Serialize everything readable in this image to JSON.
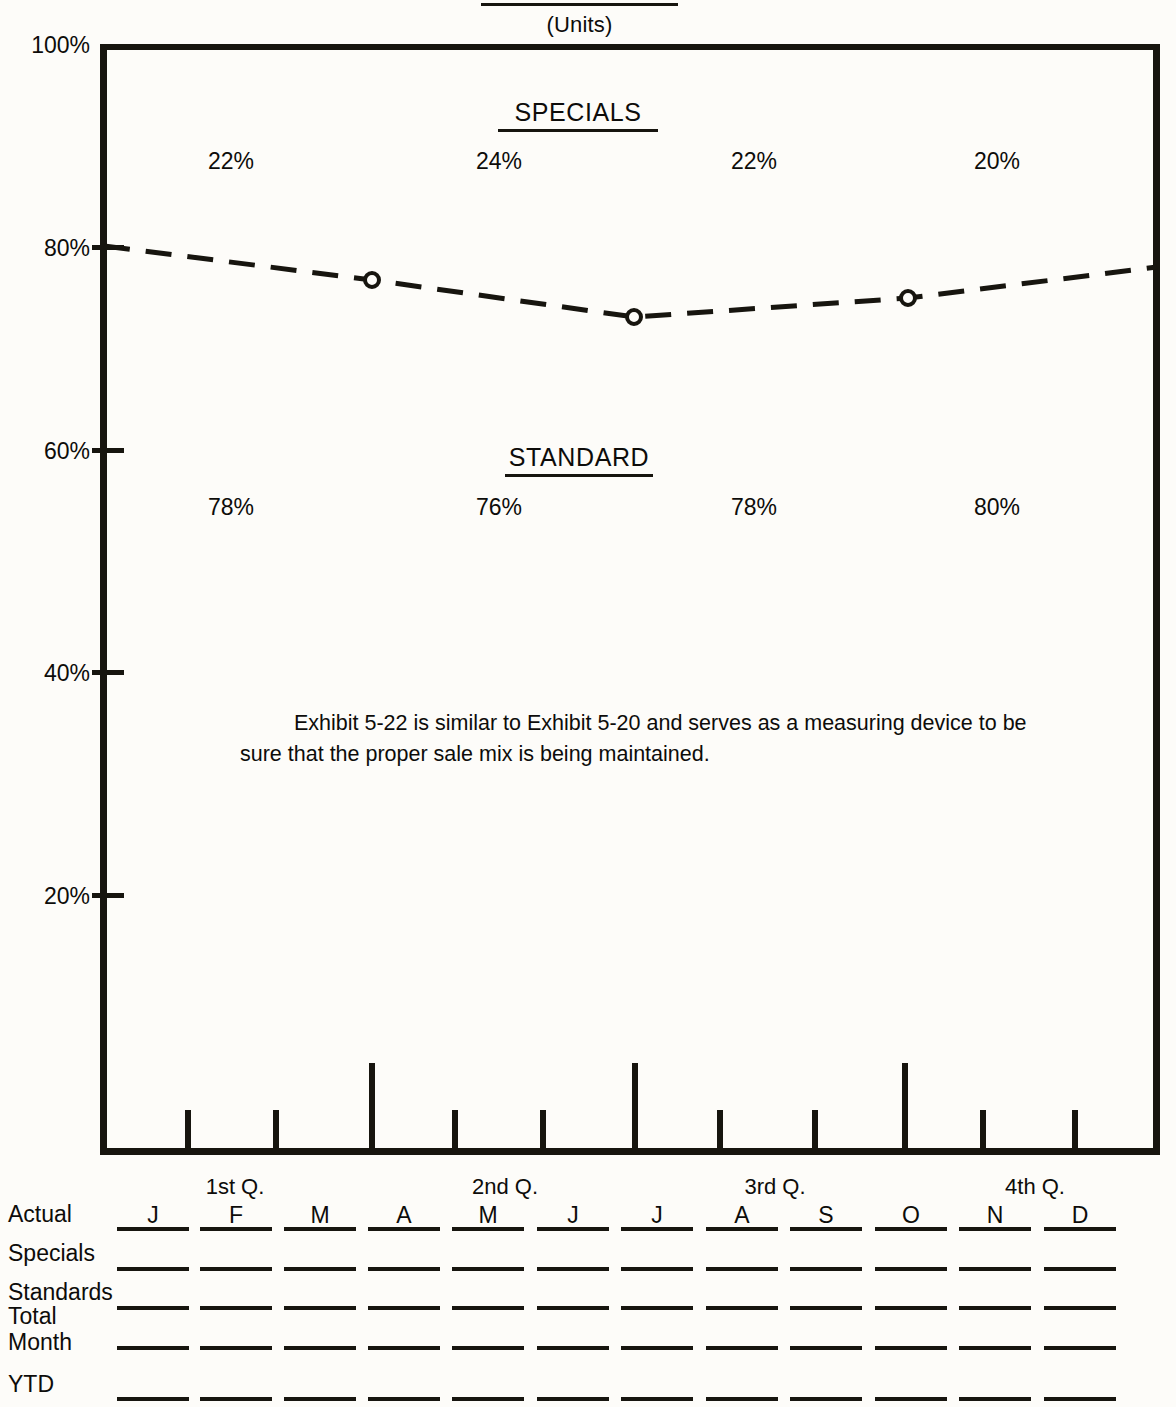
{
  "header": {
    "units_label": "(Units)"
  },
  "chart_data": {
    "type": "line",
    "title": "(Units)",
    "xlabel": "",
    "ylabel": "",
    "ylim": [
      0,
      100
    ],
    "y_ticks": [
      "100%",
      "80%",
      "60%",
      "40%",
      "20%"
    ],
    "grid": false,
    "legend_position": "in-plot",
    "series": [
      {
        "name": "STANDARD",
        "note": "Dashed cumulative line; area below the line is STANDARD share, area above is SPECIALS share.",
        "x": [
          "Jan",
          "Mar-Apr",
          "Jun-Jul",
          "Sep-Oct",
          "Dec"
        ],
        "values": [
          80,
          76.5,
          73,
          74.5,
          78
        ],
        "markers": [
          false,
          true,
          true,
          true,
          false
        ]
      }
    ],
    "annotations": {
      "specials_heading": "SPECIALS",
      "standard_heading": "STANDARD",
      "specials_values": [
        "22%",
        "24%",
        "22%",
        "20%"
      ],
      "standard_values": [
        "78%",
        "76%",
        "78%",
        "80%"
      ],
      "note_paragraph": "Exhibit 5-22 is similar to Exhibit 5-20 and serves as a measuring device to be sure that the proper sale mix is being maintained."
    },
    "quarters": [
      "1st Q.",
      "2nd Q.",
      "3rd Q.",
      "4th Q."
    ],
    "months": [
      "J",
      "F",
      "M",
      "A",
      "M",
      "J",
      "J",
      "A",
      "S",
      "O",
      "N",
      "D"
    ]
  },
  "plot": {
    "y_axis": [
      {
        "label": "100%"
      },
      {
        "label": "80%"
      },
      {
        "label": "60%"
      },
      {
        "label": "40%"
      },
      {
        "label": "20%"
      }
    ],
    "specials": {
      "heading": "SPECIALS",
      "values": [
        "22%",
        "24%",
        "22%",
        "20%"
      ]
    },
    "standard": {
      "heading": "STANDARD",
      "values": [
        "78%",
        "76%",
        "78%",
        "80%"
      ]
    },
    "note": "Exhibit 5-22 is similar to Exhibit 5-20 and serves as a measuring device to be sure that the proper sale mix is being maintained.",
    "quarters": [
      "1st Q.",
      "2nd Q.",
      "3rd Q.",
      "4th Q."
    ]
  },
  "table": {
    "months": [
      "J",
      "F",
      "M",
      "A",
      "M",
      "J",
      "J",
      "A",
      "S",
      "O",
      "N",
      "D"
    ],
    "rows": [
      {
        "label": "Actual",
        "label2": "",
        "values": [
          "",
          "",
          "",
          "",
          "",
          "",
          "",
          "",
          "",
          "",
          "",
          ""
        ]
      },
      {
        "label": "Specials",
        "label2": "",
        "values": [
          "",
          "",
          "",
          "",
          "",
          "",
          "",
          "",
          "",
          "",
          "",
          ""
        ]
      },
      {
        "label": "Standards",
        "label2": "",
        "values": [
          "",
          "",
          "",
          "",
          "",
          "",
          "",
          "",
          "",
          "",
          "",
          ""
        ]
      },
      {
        "label": "Total",
        "label2": "Month",
        "values": [
          "",
          "",
          "",
          "",
          "",
          "",
          "",
          "",
          "",
          "",
          "",
          ""
        ]
      },
      {
        "label": "YTD",
        "label2": "",
        "values": [
          "",
          "",
          "",
          "",
          "",
          "",
          "",
          "",
          "",
          "",
          "",
          ""
        ]
      }
    ]
  },
  "colors": {
    "ink": "#17150f",
    "paper": "#fdfcf9"
  }
}
